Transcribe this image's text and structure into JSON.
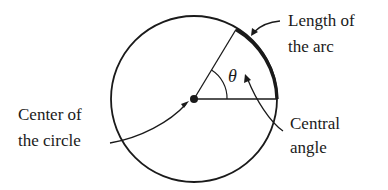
{
  "diagram": {
    "type": "circle-arc-central-angle",
    "labels": {
      "arc_length": [
        "Length of",
        "the arc"
      ],
      "center": [
        "Center of",
        "the circle"
      ],
      "central_angle": [
        "Central",
        "angle"
      ],
      "angle_symbol": "θ"
    },
    "colors": {
      "stroke": "#1a1a1a",
      "background": "#ffffff"
    }
  }
}
